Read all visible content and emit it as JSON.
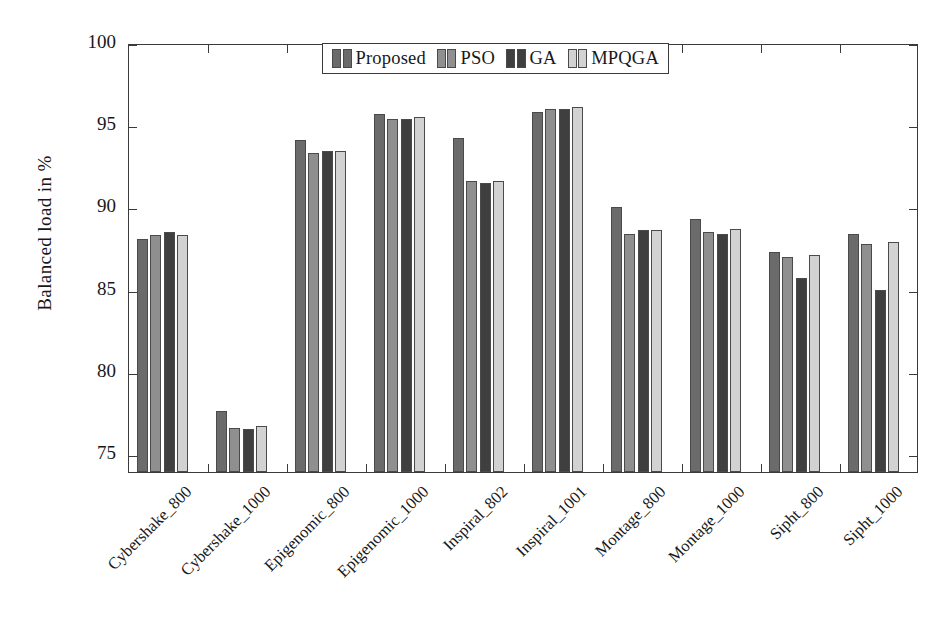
{
  "chart_data": {
    "type": "bar",
    "title": "",
    "xlabel": "",
    "ylabel": "Balanced load in %",
    "ylim": [
      73.9,
      100
    ],
    "yticks": [
      75,
      80,
      85,
      90,
      95,
      100
    ],
    "grid": false,
    "legend_position": "top-center",
    "categories": [
      "Cybershake_800",
      "Cybershake_1000",
      "Epigenomic_800",
      "Epigenomic_1000",
      "Inspiral_802",
      "Inspiral_1001",
      "Montage_800",
      "Montage_1000",
      "Sipht_800",
      "Sipht_1000"
    ],
    "series": [
      {
        "name": "Proposed",
        "color": "#6b6b6b",
        "values": [
          88.1,
          77.6,
          94.1,
          95.7,
          94.2,
          95.8,
          90.0,
          89.3,
          87.3,
          88.4
        ]
      },
      {
        "name": "PSO",
        "color": "#8f8f8f",
        "values": [
          88.3,
          76.6,
          93.3,
          95.4,
          91.6,
          96.0,
          88.4,
          88.5,
          87.0,
          87.8
        ]
      },
      {
        "name": "GA",
        "color": "#3f3f3f",
        "values": [
          88.5,
          76.5,
          93.4,
          95.4,
          91.5,
          96.0,
          88.6,
          88.4,
          85.7,
          85.0
        ]
      },
      {
        "name": "MPQGA",
        "color": "#d2d2d2",
        "values": [
          88.3,
          76.7,
          93.4,
          95.5,
          91.6,
          96.1,
          88.6,
          88.7,
          87.1,
          87.9
        ]
      }
    ]
  },
  "legend": {
    "entries": [
      {
        "label": "Proposed"
      },
      {
        "label": "PSO"
      },
      {
        "label": "GA"
      },
      {
        "label": "MPQGA"
      }
    ]
  }
}
